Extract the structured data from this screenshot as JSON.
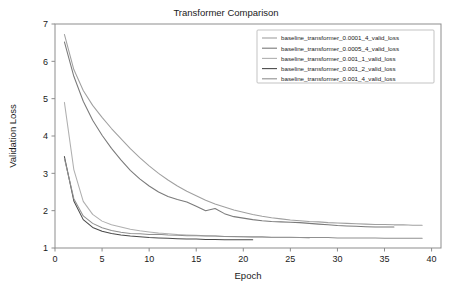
{
  "chart_data": {
    "type": "line",
    "title": "Transformer Comparison",
    "xlabel": "Epoch",
    "ylabel": "Validation Loss",
    "xlim": [
      0,
      41
    ],
    "ylim": [
      1,
      7
    ],
    "xticks": [
      0,
      5,
      10,
      15,
      20,
      25,
      30,
      35,
      40
    ],
    "yticks": [
      1,
      2,
      3,
      4,
      5,
      6,
      7
    ],
    "grid": false,
    "legend_position": "upper right",
    "series": [
      {
        "name": "baseline_transformer_0.0001_4_valid_loss",
        "color": "#a0a0a0",
        "x": [
          1,
          2,
          3,
          4,
          5,
          6,
          7,
          8,
          9,
          10,
          11,
          12,
          13,
          14,
          15,
          16,
          17,
          18,
          19,
          20,
          21,
          22,
          23,
          24,
          25,
          26,
          27,
          28,
          29,
          30,
          31,
          32,
          33,
          34,
          35,
          36,
          37,
          38,
          39
        ],
        "y": [
          6.72,
          5.78,
          5.22,
          4.82,
          4.5,
          4.2,
          3.93,
          3.66,
          3.42,
          3.2,
          3.0,
          2.82,
          2.66,
          2.52,
          2.4,
          2.28,
          2.18,
          2.1,
          2.02,
          1.96,
          1.9,
          1.85,
          1.81,
          1.78,
          1.75,
          1.73,
          1.71,
          1.7,
          1.68,
          1.67,
          1.66,
          1.65,
          1.64,
          1.63,
          1.63,
          1.62,
          1.62,
          1.61,
          1.61
        ]
      },
      {
        "name": "baseline_transformer_0.0005_4_valid_loss",
        "color": "#7a7a7a",
        "x": [
          1,
          2,
          3,
          4,
          5,
          6,
          7,
          8,
          9,
          10,
          11,
          12,
          13,
          14,
          15,
          16,
          17,
          18,
          19,
          20,
          21,
          22,
          23,
          24,
          25,
          26,
          27,
          28,
          29,
          30,
          31,
          32,
          33,
          34,
          35,
          36
        ],
        "y": [
          6.52,
          5.6,
          4.93,
          4.42,
          4.02,
          3.67,
          3.36,
          3.08,
          2.85,
          2.66,
          2.5,
          2.38,
          2.3,
          2.23,
          2.12,
          2.0,
          2.06,
          1.92,
          1.84,
          1.8,
          1.76,
          1.73,
          1.71,
          1.7,
          1.69,
          1.68,
          1.66,
          1.64,
          1.62,
          1.6,
          1.59,
          1.58,
          1.57,
          1.56,
          1.56,
          1.56
        ]
      },
      {
        "name": "baseline_transformer_0.001_1_valid_loss",
        "color": "#b0b0b0",
        "x": [
          1,
          2,
          3,
          4,
          5,
          6,
          7,
          8,
          9,
          10,
          11,
          12,
          13,
          14,
          15,
          16,
          17,
          18,
          19,
          20,
          21,
          22,
          23,
          24,
          25,
          26,
          27
        ],
        "y": [
          4.9,
          3.1,
          2.25,
          1.9,
          1.72,
          1.62,
          1.56,
          1.5,
          1.46,
          1.43,
          1.4,
          1.38,
          1.36,
          1.35,
          1.34,
          1.33,
          1.32,
          1.31,
          1.3,
          1.3,
          1.29,
          1.29,
          1.28,
          1.28,
          1.28,
          1.28,
          1.27
        ]
      },
      {
        "name": "baseline_transformer_0.001_2_valid_loss",
        "color": "#4a4a4a",
        "x": [
          1,
          2,
          3,
          4,
          5,
          6,
          7,
          8,
          9,
          10,
          11,
          12,
          13,
          14,
          15,
          16,
          17,
          18,
          19,
          20,
          21
        ],
        "y": [
          3.45,
          2.26,
          1.76,
          1.55,
          1.45,
          1.39,
          1.35,
          1.32,
          1.3,
          1.28,
          1.27,
          1.26,
          1.25,
          1.24,
          1.24,
          1.23,
          1.23,
          1.22,
          1.22,
          1.22,
          1.22
        ]
      },
      {
        "name": "baseline_transformer_0.001_4_valid_loss",
        "color": "#909090",
        "x": [
          1,
          2,
          3,
          4,
          5,
          6,
          7,
          8,
          9,
          10,
          11,
          12,
          13,
          14,
          15,
          16,
          17,
          18,
          19,
          20,
          21,
          22,
          23,
          24,
          25,
          26,
          27,
          28,
          29,
          30,
          31,
          32,
          33,
          34,
          35,
          36,
          37,
          38,
          39
        ],
        "y": [
          3.4,
          2.32,
          1.86,
          1.66,
          1.54,
          1.47,
          1.42,
          1.39,
          1.38,
          1.36,
          1.37,
          1.35,
          1.34,
          1.33,
          1.33,
          1.32,
          1.32,
          1.31,
          1.31,
          1.3,
          1.3,
          1.3,
          1.29,
          1.29,
          1.29,
          1.28,
          1.28,
          1.28,
          1.28,
          1.27,
          1.27,
          1.27,
          1.27,
          1.27,
          1.26,
          1.26,
          1.26,
          1.26,
          1.26
        ]
      }
    ]
  },
  "figure": {
    "background": "#ffffff",
    "axis_color": "#8d8d8d",
    "text_color": "#1a1a1a"
  }
}
